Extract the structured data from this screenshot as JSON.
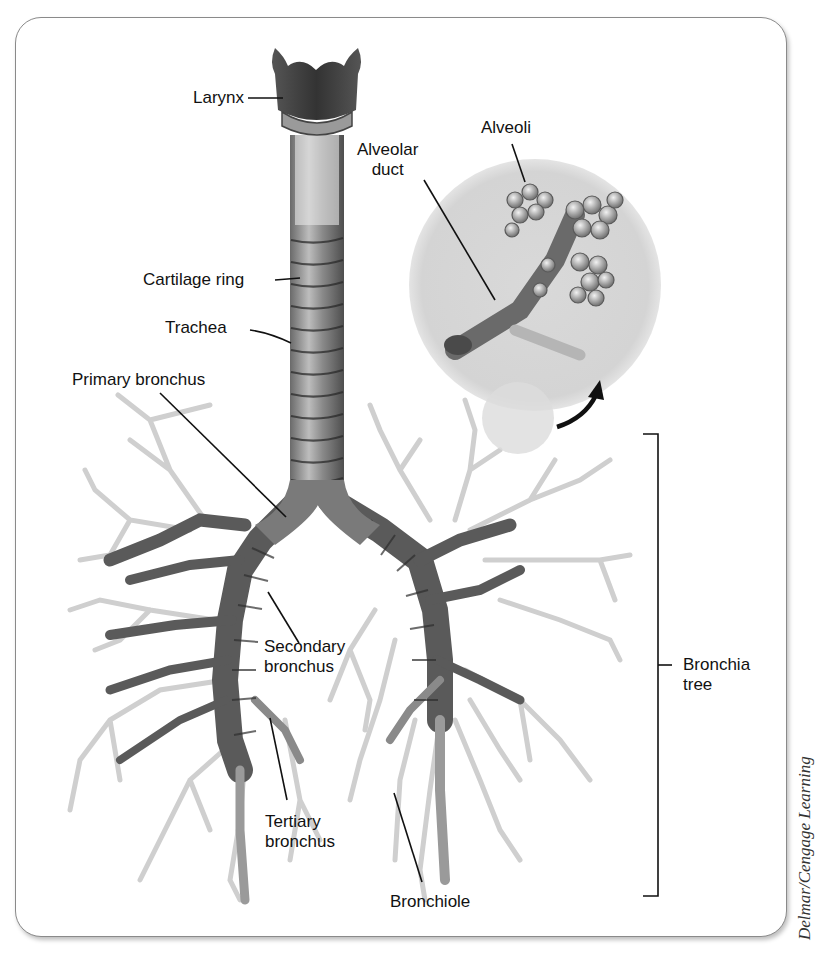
{
  "diagram": {
    "labels": {
      "larynx": "Larynx",
      "cartilage_ring": "Cartilage ring",
      "trachea": "Trachea",
      "primary_bronchus": "Primary bronchus",
      "secondary_bronchus_1": "Secondary",
      "secondary_bronchus_2": "bronchus",
      "tertiary_bronchus_1": "Tertiary",
      "tertiary_bronchus_2": "bronchus",
      "bronchiole": "Bronchiole",
      "alveolar_duct_1": "Alveolar",
      "alveolar_duct_2": "duct",
      "alveoli": "Alveoli",
      "bronchia_tree_1": "Bronchia",
      "bronchia_tree_2": "tree"
    },
    "credit": "Delmar/Cengage Learning",
    "colors": {
      "panel_border": "#8a8a8a",
      "inset_circle": "#d6d6d6",
      "airway_dark": "#4a4a4a",
      "airway_mid": "#8c8c8c",
      "bronchiole_light": "#c8c8c8",
      "leader_line": "#111111"
    }
  }
}
